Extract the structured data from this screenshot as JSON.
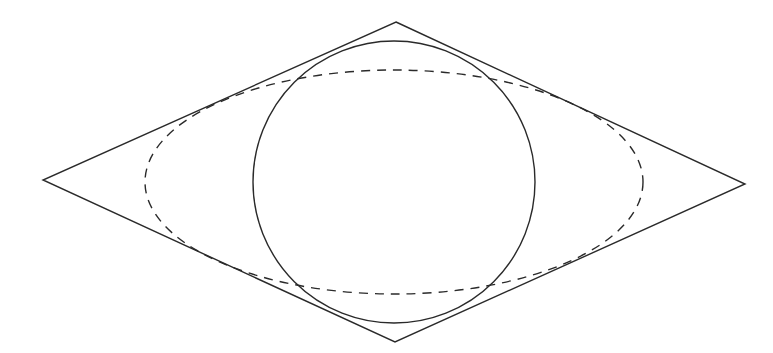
{
  "diagram": {
    "type": "geometric-figure",
    "stroke_color": "#2a2a2a",
    "background": "#ffffff",
    "rhombus": {
      "vertices": [
        [
          396,
          22
        ],
        [
          745,
          184
        ],
        [
          395,
          342
        ],
        [
          43,
          180
        ]
      ],
      "style": "solid"
    },
    "circle": {
      "cx": 394,
      "cy": 182,
      "r": 141,
      "style": "solid"
    },
    "ellipse": {
      "cx": 394,
      "cy": 182,
      "rx": 249,
      "ry": 112,
      "style": "dashed"
    }
  }
}
